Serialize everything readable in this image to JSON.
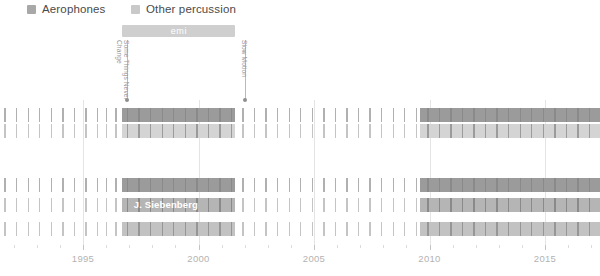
{
  "legend": {
    "items": [
      {
        "label": "Aerophones",
        "color": "#a8a8a8",
        "x": 27
      },
      {
        "label": "Other percussion",
        "color": "#c9c9c9",
        "x": 131
      }
    ]
  },
  "era": {
    "label": "emi",
    "color": "#cfcfcf",
    "start_year": 1996.7,
    "end_year": 2001.6,
    "top": 25
  },
  "events": [
    {
      "name": "some-things-never-change",
      "lines": [
        "Some Things Never",
        "Change"
      ],
      "year": 1996.9,
      "top": 40,
      "height": 60,
      "color": "#b9b9b9"
    },
    {
      "name": "slow-motion",
      "lines": [
        "Slow Motion"
      ],
      "year": 2002.0,
      "top": 40,
      "height": 60,
      "color": "#b9b9b9"
    }
  ],
  "chart_data": {
    "type": "bar",
    "title": "",
    "xlabel": "",
    "ylabel": "",
    "xlim": [
      1991.5,
      2017.4
    ],
    "grid": true,
    "legend_position": "top-left",
    "axis": {
      "ticks": [
        1995,
        2000,
        2005,
        2010,
        2015
      ],
      "tick_labels": [
        "1995",
        "2000",
        "2005",
        "2010",
        "2015"
      ],
      "minor_step": 1,
      "px_per_year": 23.1,
      "origin_x": 83,
      "origin_year": 1995
    },
    "highlight_spans": [
      {
        "start_year": 1996.7,
        "end_year": 2001.6
      },
      {
        "start_year": 2009.6,
        "end_year": 2017.4
      }
    ],
    "series": [
      {
        "name": "row-1",
        "instrument": "Aerophones",
        "top": 108,
        "height": 14,
        "tick_color": "#b0b0b0",
        "highlight_color": "#9b9b9b",
        "highlight_tick_color": "#8a8a8a",
        "values": [
          1991.6,
          1992.1,
          1992.6,
          1993.1,
          1993.6,
          1994.1,
          1994.6,
          1995.1,
          1995.6,
          1996.0,
          1996.4,
          1996.9,
          1997.4,
          1997.9,
          1998.4,
          1998.9,
          1999.4,
          1999.9,
          2000.4,
          2000.9,
          2001.4,
          2001.9,
          2002.4,
          2002.9,
          2003.4,
          2003.9,
          2004.4,
          2004.9,
          2005.4,
          2005.9,
          2006.4,
          2006.9,
          2007.4,
          2007.9,
          2008.4,
          2008.9,
          2009.4,
          2009.9,
          2010.4,
          2010.9,
          2011.4,
          2011.9,
          2012.4,
          2012.9,
          2013.4,
          2013.9,
          2014.4,
          2014.9,
          2015.4,
          2015.9,
          2016.4,
          2016.9
        ]
      },
      {
        "name": "row-2",
        "instrument": "Other percussion",
        "top": 124,
        "height": 14,
        "tick_color": "#c4c4c4",
        "highlight_color": "#d4d4d4",
        "highlight_tick_color": "#9b9b9b",
        "values": [
          1991.6,
          1992.1,
          1992.6,
          1993.1,
          1993.6,
          1994.1,
          1994.6,
          1995.1,
          1995.6,
          1996.0,
          1996.4,
          1996.9,
          1997.4,
          1997.9,
          1998.4,
          1998.9,
          1999.4,
          1999.9,
          2000.4,
          2000.9,
          2001.4,
          2001.9,
          2002.4,
          2002.9,
          2003.4,
          2003.9,
          2004.4,
          2004.9,
          2005.4,
          2005.9,
          2006.4,
          2006.9,
          2007.4,
          2007.9,
          2008.4,
          2008.9,
          2009.4,
          2009.9,
          2010.4,
          2010.9,
          2011.4,
          2011.9,
          2012.4,
          2012.9,
          2013.4,
          2013.9,
          2014.4,
          2014.9,
          2015.4,
          2015.9,
          2016.4,
          2016.9
        ]
      },
      {
        "name": "row-3",
        "instrument": "Aerophones",
        "top": 178,
        "height": 14,
        "tick_color": "#b0b0b0",
        "highlight_color": "#9b9b9b",
        "highlight_tick_color": "#8a8a8a",
        "values": [
          1991.6,
          1992.1,
          1992.6,
          1993.1,
          1993.6,
          1994.1,
          1994.6,
          1995.1,
          1995.6,
          1996.0,
          1996.4,
          1996.9,
          1997.4,
          1997.9,
          1998.4,
          1998.9,
          1999.4,
          1999.9,
          2000.4,
          2000.9,
          2001.4,
          2001.9,
          2002.4,
          2002.9,
          2003.4,
          2003.9,
          2004.4,
          2004.9,
          2005.4,
          2005.9,
          2006.4,
          2006.9,
          2007.4,
          2007.9,
          2008.4,
          2008.9,
          2009.4,
          2009.9,
          2010.4,
          2010.9,
          2011.4,
          2011.9,
          2012.4,
          2012.9,
          2013.4,
          2013.9,
          2014.4,
          2014.9,
          2015.4,
          2015.9,
          2016.4,
          2016.9
        ]
      },
      {
        "name": "row-4",
        "instrument": "Other percussion",
        "label": "J. Siebenberg",
        "label_year": 1997.2,
        "top": 198,
        "height": 14,
        "tick_color": "#c4c4c4",
        "highlight_color": "#b5b5b5",
        "highlight_tick_color": "#8a8a8a",
        "values": [
          1991.6,
          1992.1,
          1992.6,
          1993.1,
          1993.6,
          1994.1,
          1994.6,
          1995.1,
          1995.6,
          1996.0,
          1996.4,
          1996.9,
          1997.4,
          1997.9,
          1998.4,
          1998.9,
          1999.4,
          1999.9,
          2000.4,
          2000.9,
          2001.4,
          2001.9,
          2002.4,
          2002.9,
          2003.4,
          2003.9,
          2004.4,
          2004.9,
          2005.4,
          2005.9,
          2006.4,
          2006.9,
          2007.4,
          2007.9,
          2008.4,
          2008.9,
          2009.4,
          2009.9,
          2010.4,
          2010.9,
          2011.4,
          2011.9,
          2012.4,
          2012.9,
          2013.4,
          2013.9,
          2014.4,
          2014.9,
          2015.4,
          2015.9,
          2016.4,
          2016.9
        ]
      },
      {
        "name": "row-5",
        "instrument": "Other percussion",
        "top": 222,
        "height": 14,
        "tick_color": "#c4c4c4",
        "highlight_color": "#c2c2c2",
        "highlight_tick_color": "#969696",
        "values": [
          1991.6,
          1992.1,
          1992.6,
          1993.1,
          1993.6,
          1994.1,
          1994.6,
          1995.1,
          1995.6,
          1996.0,
          1996.4,
          1996.9,
          1997.4,
          1997.9,
          1998.4,
          1998.9,
          1999.4,
          1999.9,
          2000.4,
          2000.9,
          2001.4,
          2001.9,
          2002.4,
          2002.9,
          2003.4,
          2003.9,
          2004.4,
          2004.9,
          2005.4,
          2005.9,
          2006.4,
          2006.9,
          2007.4,
          2007.9,
          2008.4,
          2008.9,
          2009.4,
          2009.9,
          2010.4,
          2010.9,
          2011.4,
          2011.9,
          2012.4,
          2012.9,
          2013.4,
          2013.9,
          2014.4,
          2014.9,
          2015.4,
          2015.9,
          2016.4,
          2016.9
        ]
      }
    ]
  }
}
